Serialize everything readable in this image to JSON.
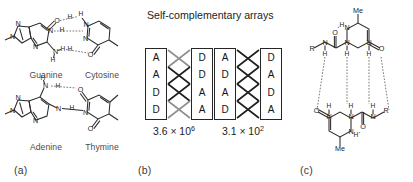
{
  "figure": {
    "panels": [
      {
        "id": "a",
        "label": "(a)"
      },
      {
        "id": "b",
        "label": "(b)"
      },
      {
        "id": "c",
        "label": "(c)"
      }
    ]
  },
  "panel_a": {
    "label": "(a)",
    "pairs": [
      {
        "name": "guanine-cytosine",
        "left_base": "Guanine",
        "right_base": "Cytosine",
        "hydrogen_bonds": 3
      },
      {
        "name": "adenine-thymine",
        "left_base": "Adenine",
        "right_base": "Thymine",
        "hydrogen_bonds": 2
      }
    ],
    "atoms": {
      "n": "N",
      "o": "O",
      "h": "H"
    }
  },
  "panel_b": {
    "label": "(b)",
    "title": "Self-complementary arrays",
    "arrays": [
      {
        "id": "array-1",
        "left_column": [
          "A",
          "A",
          "D",
          "D"
        ],
        "right_column": [
          "D",
          "D",
          "A",
          "A"
        ],
        "linker_shades": [
          "gray",
          "black",
          "black",
          "gray"
        ],
        "k_mantissa": "3.6 × 10",
        "k_exponent": "6",
        "k_value": "3.6 × 10⁶"
      },
      {
        "id": "array-2",
        "left_column": [
          "A",
          "D",
          "A",
          "D"
        ],
        "right_column": [
          "D",
          "A",
          "D",
          "A"
        ],
        "linker_shades": [
          "black",
          "black",
          "black",
          "black"
        ],
        "k_mantissa": "3.1 × 10",
        "k_exponent": "2",
        "k_value": "3.1 × 10²"
      }
    ]
  },
  "panel_c": {
    "label": "(c)",
    "name": "ureidopyrimidinone-quadruple-hydrogen-bonded-dimer",
    "hydrogen_bonds": 4,
    "substituents": {
      "methyl_top": "Me",
      "methyl_bottom": "Me",
      "r_group_left": "R",
      "r_group_right": "R"
    },
    "atoms": {
      "n": "N",
      "o": "O",
      "h": "H"
    }
  },
  "colors": {
    "ink": "#1e1e1e",
    "bond": "#2b2b2b",
    "hbond": "#5d5d5d",
    "linker_gray": "#8f8f8f",
    "linker_black": "#1f1f1f",
    "background": "#ffffff"
  }
}
